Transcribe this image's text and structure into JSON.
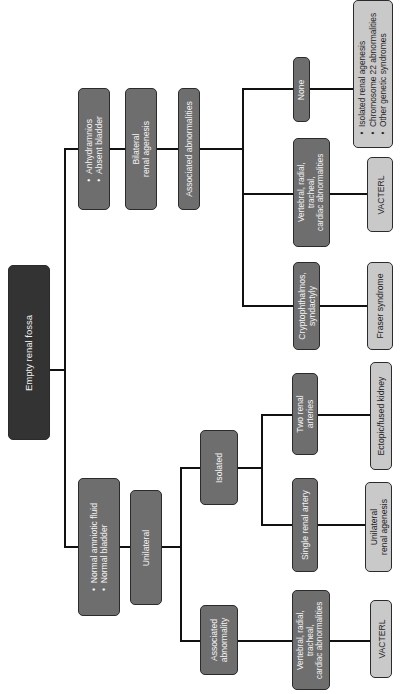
{
  "diagram": {
    "title": "Empty renal fossa",
    "orientation": "rotated-90-ccw",
    "colors": {
      "root": "#333333",
      "intermediate": "#6e6e6e",
      "outcome": "#c9c9c9",
      "connector": "#111111"
    },
    "root": {
      "label": "Empty renal fossa"
    },
    "bilateral": {
      "findings": [
        "Anhydramnios",
        "Absent bladder"
      ],
      "diagnosis": {
        "line1": "Bilateral",
        "line2": "renal agenesis"
      },
      "associated": {
        "label": "Associated abnormalities"
      },
      "branches": [
        {
          "condition": {
            "line1": "Cryptophthalmos,",
            "line2": "syndactyly"
          },
          "outcome": "Fraser syndrome"
        },
        {
          "condition": {
            "line1": "Vertebral, radial,",
            "line2": "tracheal,",
            "line3": "cardiac abnormalities"
          },
          "outcome": "VACTERL"
        },
        {
          "condition": {
            "line1": "None"
          },
          "outcome_list": [
            "Isolated renal agenesis",
            "Chromosome 22 abnormalities",
            "Other genetic syndromes"
          ]
        }
      ]
    },
    "unilateral": {
      "findings": [
        "Normal amniotic fluid",
        "Normal bladder"
      ],
      "diagnosis": {
        "line1": "Unilateral"
      },
      "isolated": {
        "label": "Isolated",
        "branches": [
          {
            "condition": {
              "line1": "Two renal",
              "line2": "arteries"
            },
            "outcome": "Ectopic/fused kidney"
          },
          {
            "condition": {
              "line1": "Single renal artery"
            },
            "outcome": {
              "line1": "Unilateral",
              "line2": "renal agenesis"
            }
          }
        ]
      },
      "associated": {
        "label": {
          "line1": "Associated",
          "line2": "abnormality"
        },
        "condition": {
          "line1": "Vertebral, radial,",
          "line2": "tracheal,",
          "line3": "cardiac abnormalities"
        },
        "outcome": "VACTERL"
      }
    }
  }
}
